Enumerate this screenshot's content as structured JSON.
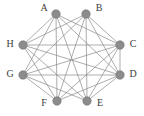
{
  "figure": {
    "name": "octagonal-graph-diagram",
    "type": "undirected-graph",
    "width": 144,
    "height": 116,
    "background_color": "#ffffff"
  },
  "style": {
    "node_fill": "#8c8c8c",
    "node_stroke": "#6e6e6e",
    "node_radius": 4.2,
    "edge_color": "#8a8a8a",
    "edge_width": 0.7,
    "label_color": "#3c3c3c",
    "label_font_size": 10
  },
  "graph_data": {
    "type": "graph",
    "layout": "octagon",
    "node_count": 8,
    "edge_count": 25,
    "nodes": [
      {
        "id": "A",
        "label": "A",
        "x": 56,
        "y": 14,
        "label_x": 44,
        "label_y": 9
      },
      {
        "id": "B",
        "label": "B",
        "x": 86,
        "y": 14,
        "label_x": 99,
        "label_y": 9
      },
      {
        "id": "C",
        "label": "C",
        "x": 120,
        "y": 45,
        "label_x": 133,
        "label_y": 45
      },
      {
        "id": "D",
        "label": "D",
        "x": 120,
        "y": 75,
        "label_x": 133,
        "label_y": 75
      },
      {
        "id": "E",
        "label": "E",
        "x": 87,
        "y": 101,
        "label_x": 100,
        "label_y": 104
      },
      {
        "id": "F",
        "label": "F",
        "x": 57,
        "y": 101,
        "label_x": 44,
        "label_y": 104
      },
      {
        "id": "G",
        "label": "G",
        "x": 23,
        "y": 75,
        "label_x": 10,
        "label_y": 75
      },
      {
        "id": "H",
        "label": "H",
        "x": 23,
        "y": 45,
        "label_x": 10,
        "label_y": 45
      }
    ],
    "edges": [
      {
        "from": "A",
        "to": "C"
      },
      {
        "from": "A",
        "to": "D"
      },
      {
        "from": "A",
        "to": "E"
      },
      {
        "from": "A",
        "to": "F"
      },
      {
        "from": "A",
        "to": "G"
      },
      {
        "from": "A",
        "to": "H"
      },
      {
        "from": "B",
        "to": "C"
      },
      {
        "from": "B",
        "to": "D"
      },
      {
        "from": "B",
        "to": "E"
      },
      {
        "from": "B",
        "to": "F"
      },
      {
        "from": "B",
        "to": "G"
      },
      {
        "from": "B",
        "to": "H"
      },
      {
        "from": "C",
        "to": "D"
      },
      {
        "from": "C",
        "to": "E"
      },
      {
        "from": "C",
        "to": "F"
      },
      {
        "from": "C",
        "to": "G"
      },
      {
        "from": "C",
        "to": "H"
      },
      {
        "from": "D",
        "to": "E"
      },
      {
        "from": "D",
        "to": "F"
      },
      {
        "from": "D",
        "to": "G"
      },
      {
        "from": "D",
        "to": "H"
      },
      {
        "from": "E",
        "to": "G"
      },
      {
        "from": "E",
        "to": "H"
      },
      {
        "from": "F",
        "to": "G"
      },
      {
        "from": "F",
        "to": "H"
      }
    ]
  }
}
